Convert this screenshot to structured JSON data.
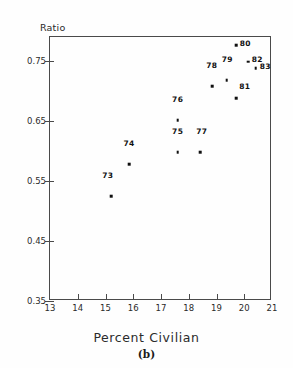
{
  "figure": {
    "caption": "(b)",
    "xaxis_title": "Percent Civilian",
    "yaxis_title": "Ratio"
  },
  "chart_data": {
    "type": "scatter",
    "title": "",
    "subtitle": "",
    "xlabel": "Percent Civilian",
    "ylabel": "Ratio",
    "caption": "(b)",
    "xlim": [
      13,
      21
    ],
    "ylim": [
      0.35,
      0.79
    ],
    "xticks": [
      13,
      14,
      15,
      16,
      17,
      18,
      19,
      20,
      21
    ],
    "xticklabels": [
      "13",
      "14",
      "15",
      "16",
      "17",
      "18",
      "19",
      "20",
      "21"
    ],
    "yticks": [
      0.35,
      0.45,
      0.55,
      0.65,
      0.75
    ],
    "yticklabels": [
      "0.35",
      "0.45",
      "0.55",
      "0.65",
      "0.75"
    ],
    "grid": false,
    "legend": null,
    "marker": "filled-square-dot",
    "point_label_position": "above",
    "points": [
      {
        "label": "73",
        "x": 15.2,
        "y": 0.525,
        "label_dx": -0.12,
        "label_dy": 0.035
      },
      {
        "label": "74",
        "x": 15.85,
        "y": 0.578,
        "label_dx": 0.0,
        "label_dy": 0.035
      },
      {
        "label": "75",
        "x": 17.6,
        "y": 0.598,
        "label_dx": 0.0,
        "label_dy": 0.035
      },
      {
        "label": "76",
        "x": 17.6,
        "y": 0.651,
        "label_dx": 0.0,
        "label_dy": 0.035
      },
      {
        "label": "77",
        "x": 18.42,
        "y": 0.598,
        "label_dx": 0.05,
        "label_dy": 0.035
      },
      {
        "label": "78",
        "x": 18.85,
        "y": 0.708,
        "label_dx": -0.02,
        "label_dy": 0.035
      },
      {
        "label": "79",
        "x": 19.37,
        "y": 0.718,
        "label_dx": 0.02,
        "label_dy": 0.035
      },
      {
        "label": "80",
        "x": 19.72,
        "y": 0.776,
        "label_dx": 0.32,
        "label_dy": 0.004
      },
      {
        "label": "81",
        "x": 19.72,
        "y": 0.688,
        "label_dx": 0.3,
        "label_dy": 0.02
      },
      {
        "label": "82",
        "x": 20.15,
        "y": 0.749,
        "label_dx": 0.32,
        "label_dy": 0.005
      },
      {
        "label": "83",
        "x": 20.42,
        "y": 0.738,
        "label_dx": 0.34,
        "label_dy": 0.004
      }
    ]
  }
}
